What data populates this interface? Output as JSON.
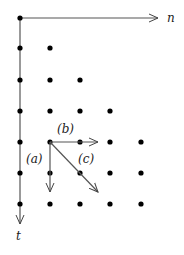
{
  "diagram": {
    "axes": {
      "horizontal_label": "n",
      "vertical_label": "t"
    },
    "grid": {
      "description": "lower-triangular lattice of points; row r (0..6) has r+1 points, max 5 per row visible",
      "rows": [
        {
          "t": 0,
          "count": 1
        },
        {
          "t": 1,
          "count": 2
        },
        {
          "t": 2,
          "count": 3
        },
        {
          "t": 3,
          "count": 4
        },
        {
          "t": 4,
          "count": 5
        },
        {
          "t": 5,
          "count": 5
        },
        {
          "t": 6,
          "count": 5
        }
      ]
    },
    "arrows": [
      {
        "label": "(a)",
        "direction": "down"
      },
      {
        "label": "(b)",
        "direction": "right"
      },
      {
        "label": "(c)",
        "direction": "diagonal down-right"
      }
    ]
  }
}
